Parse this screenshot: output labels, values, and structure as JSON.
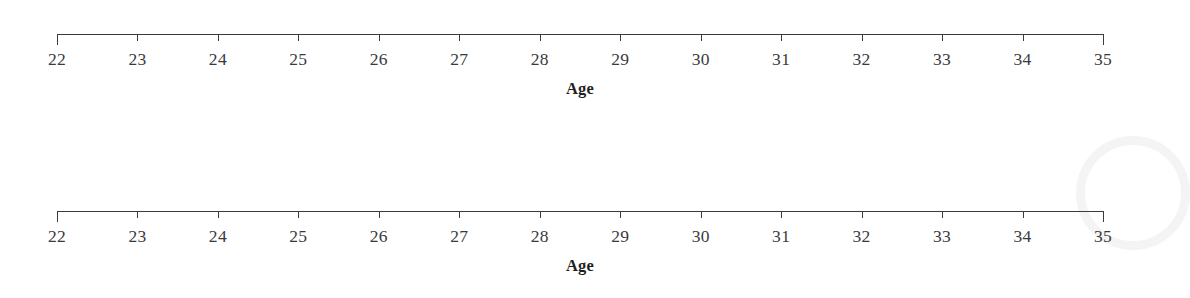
{
  "figure": {
    "background_color": "#ffffff",
    "line_color": "#3b3b3f",
    "label_color": "#3a3a3e",
    "title_color": "#1f1f22",
    "watermark": {
      "name": "circular-watermark",
      "color": "#f2f2f3"
    }
  },
  "chart_data": {
    "type": "table",
    "title": "",
    "subtitle": "",
    "xlabel": "Age",
    "ylabel": "",
    "grid": false,
    "legend": null,
    "axes": [
      {
        "name": "age-axis-top",
        "xlabel": "Age",
        "xlim": [
          22,
          35
        ],
        "tick_step": 1,
        "tick_values": [
          22,
          23,
          24,
          25,
          26,
          27,
          28,
          29,
          30,
          31,
          32,
          33,
          34,
          35
        ],
        "tick_labels": [
          "22",
          "23",
          "24",
          "25",
          "26",
          "27",
          "28",
          "29",
          "30",
          "31",
          "32",
          "33",
          "34",
          "35"
        ],
        "series": [],
        "values": []
      },
      {
        "name": "age-axis-bottom",
        "xlabel": "Age",
        "xlim": [
          22,
          35
        ],
        "tick_step": 1,
        "tick_values": [
          22,
          23,
          24,
          25,
          26,
          27,
          28,
          29,
          30,
          31,
          32,
          33,
          34,
          35
        ],
        "tick_labels": [
          "22",
          "23",
          "24",
          "25",
          "26",
          "27",
          "28",
          "29",
          "30",
          "31",
          "32",
          "33",
          "34",
          "35"
        ],
        "series": [],
        "values": []
      }
    ]
  }
}
